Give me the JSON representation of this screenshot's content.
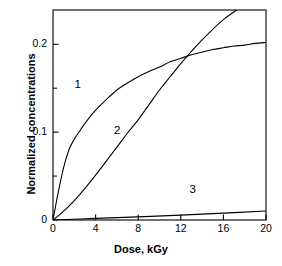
{
  "chart_data": {
    "type": "line",
    "title": "",
    "xlabel": "Dose, kGy",
    "ylabel": "Normalized concentrations",
    "xlim": [
      0,
      20
    ],
    "ylim": [
      0,
      0.239
    ],
    "xticks": [
      0,
      4,
      8,
      12,
      16,
      20
    ],
    "xticklabels": [
      "0",
      "4",
      "8",
      "12",
      "16",
      "20"
    ],
    "yticks": [
      0,
      0.1,
      0.2
    ],
    "yticklabels": [
      "0",
      "0.1",
      "0.2"
    ],
    "yminorticks": [
      0.05,
      0.15
    ],
    "grid": false,
    "legend": "inline-curve-labels",
    "frame": "box",
    "series": [
      {
        "name": "1",
        "label": "1",
        "label_x": 2.3,
        "label_y": 0.153,
        "x": [
          0,
          0.5,
          1,
          1.5,
          2,
          2.5,
          3,
          4,
          5,
          6,
          7,
          8,
          9,
          10,
          11,
          12,
          13,
          14,
          15,
          16,
          17,
          18,
          19,
          20
        ],
        "y": [
          0,
          0.032,
          0.06,
          0.08,
          0.092,
          0.101,
          0.11,
          0.125,
          0.137,
          0.148,
          0.156,
          0.163,
          0.169,
          0.174,
          0.18,
          0.184,
          0.188,
          0.191,
          0.194,
          0.196,
          0.198,
          0.199,
          0.201,
          0.202
        ]
      },
      {
        "name": "2",
        "label": "2",
        "label_x": 6.0,
        "label_y": 0.1005,
        "x": [
          0,
          1,
          2,
          3,
          4,
          5,
          6,
          7,
          8,
          9,
          10,
          11,
          12,
          13,
          14,
          15,
          16,
          17,
          17.25
        ],
        "y": [
          0,
          0.01,
          0.022,
          0.036,
          0.051,
          0.067,
          0.083,
          0.099,
          0.114,
          0.131,
          0.148,
          0.163,
          0.178,
          0.192,
          0.205,
          0.217,
          0.228,
          0.237,
          0.239
        ]
      },
      {
        "name": "3",
        "label": "3",
        "label_x": 13.1,
        "label_y": 0.0325,
        "x": [
          0,
          4,
          8,
          12,
          16,
          20
        ],
        "y": [
          0,
          0.0018,
          0.0036,
          0.0056,
          0.0078,
          0.0102
        ]
      }
    ],
    "colors": {
      "curve": "#000000",
      "axis": "#000000",
      "background": "#ffffff"
    }
  }
}
